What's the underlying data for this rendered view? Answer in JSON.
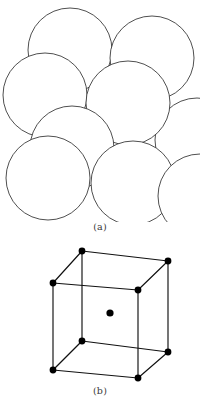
{
  "figure": {
    "line_color": "#3b3b3b",
    "fill_color": "#ffffff",
    "vertex_color": "#000000",
    "background_color": "#ffffff",
    "panels": [
      {
        "id": "a",
        "caption": "(a)",
        "kind": "hard-sphere-model",
        "description": "Hard sphere unit cell representation of the body-centered cubic crystal structure",
        "sphere_radius": 42,
        "sphere_count": 9,
        "spheres": [
          {
            "name": "sphere-top-center",
            "cx": 70,
            "cy": 50,
            "r": 42,
            "order": 1
          },
          {
            "name": "sphere-top-right",
            "cx": 152,
            "cy": 58,
            "r": 42,
            "order": 2
          },
          {
            "name": "sphere-mid-left",
            "cx": 45,
            "cy": 95,
            "r": 42,
            "order": 3
          },
          {
            "name": "sphere-right-edge",
            "cx": 197,
            "cy": 140,
            "r": 42,
            "order": 4
          },
          {
            "name": "sphere-mid-center",
            "cx": 128,
            "cy": 103,
            "r": 42,
            "order": 5
          },
          {
            "name": "sphere-body-center",
            "cx": 72,
            "cy": 148,
            "r": 42,
            "order": 6
          },
          {
            "name": "sphere-bottom-left",
            "cx": 48,
            "cy": 178,
            "r": 42,
            "order": 7
          },
          {
            "name": "sphere-bottom-right",
            "cx": 133,
            "cy": 183,
            "r": 42,
            "order": 8
          },
          {
            "name": "sphere-far-right-low",
            "cx": 200,
            "cy": 196,
            "r": 42,
            "order": 9
          }
        ]
      },
      {
        "id": "b",
        "caption": "(b)",
        "kind": "reduced-sphere-unit-cell",
        "description": "Reduced sphere unit cell showing atom positions at the eight cube corners and the cube center",
        "vertex_radius": 3.4,
        "atom_count": 9,
        "cube": {
          "front_face": [
            {
              "name": "vertex-front-top-left",
              "x": 53,
              "y": 283
            },
            {
              "name": "vertex-front-top-right",
              "x": 138,
              "y": 290
            },
            {
              "name": "vertex-front-bottom-right",
              "x": 138,
              "y": 378
            },
            {
              "name": "vertex-front-bottom-left",
              "x": 53,
              "y": 370
            }
          ],
          "back_face": [
            {
              "name": "vertex-back-top-left",
              "x": 82,
              "y": 251
            },
            {
              "name": "vertex-back-top-right",
              "x": 168,
              "y": 261
            },
            {
              "name": "vertex-back-bottom-right",
              "x": 168,
              "y": 352
            },
            {
              "name": "vertex-back-bottom-left",
              "x": 82,
              "y": 341
            }
          ],
          "center_atom": {
            "name": "atom-body-center",
            "x": 110,
            "y": 313
          }
        }
      }
    ]
  }
}
